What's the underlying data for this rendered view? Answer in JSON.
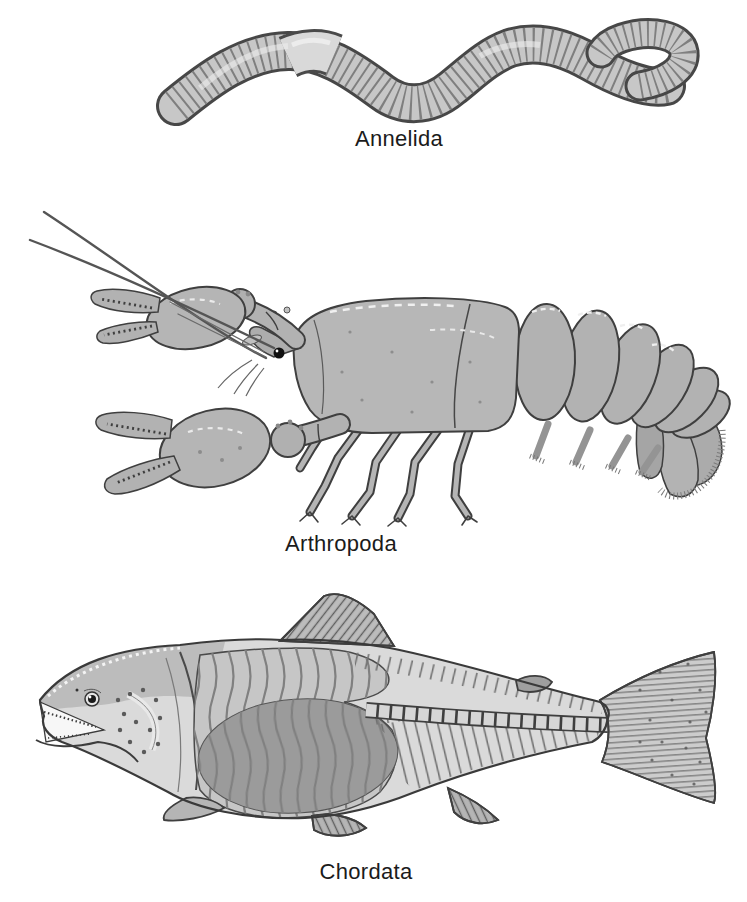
{
  "figure": {
    "background": "#ffffff",
    "ink_color": "#3f3f3f",
    "body_gray": "#c6c6c6",
    "label_color": "#1b1b1b",
    "panels": [
      {
        "label": "Annelida"
      },
      {
        "label": "Arthropoda"
      },
      {
        "label": "Chordata"
      }
    ]
  }
}
